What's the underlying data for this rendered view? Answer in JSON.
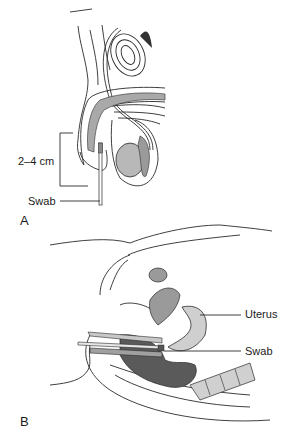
{
  "figure": {
    "panel_a": {
      "letter": "A",
      "labels": {
        "measure": "2–4 cm",
        "swab": "Swab"
      }
    },
    "panel_b": {
      "letter": "B",
      "labels": {
        "uterus": "Uterus",
        "swab": "Swab"
      }
    },
    "colors": {
      "line": "#2a2a2a",
      "shade_light": "#d8d8d8",
      "shade_mid": "#a9a9a9",
      "shade_dark": "#555555"
    }
  }
}
